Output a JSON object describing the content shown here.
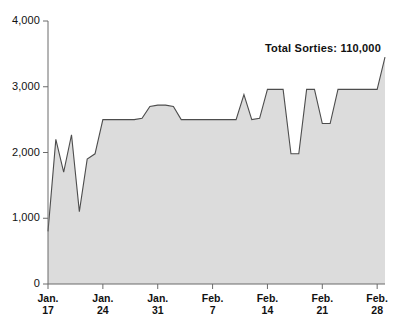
{
  "chart_data": {
    "type": "area",
    "title": "",
    "subtitle": "",
    "xlabel": "",
    "ylabel": "",
    "ylim": [
      0,
      4000
    ],
    "grid": false,
    "legend": null,
    "annotation": "Total  Sorties:  110,000",
    "annotation_label": "Total  Sorties:",
    "annotation_value": "110,000",
    "y_ticks": [
      "4,000",
      "3,000",
      "2,000",
      "1,000",
      "0"
    ],
    "y_tick_values": [
      4000,
      3000,
      2000,
      1000,
      0
    ],
    "x_ticks": [
      {
        "line1": "Jan.",
        "line2": "17"
      },
      {
        "line1": "Jan.",
        "line2": "24"
      },
      {
        "line1": "Jan.",
        "line2": "31"
      },
      {
        "line1": "Feb.",
        "line2": "7"
      },
      {
        "line1": "Feb.",
        "line2": "14"
      },
      {
        "line1": "Feb.",
        "line2": "21"
      },
      {
        "line1": "Feb.",
        "line2": "28"
      }
    ],
    "x_tick_positions": [
      0,
      7,
      14,
      21,
      28,
      35,
      42
    ],
    "x": [
      0,
      1,
      2,
      3,
      4,
      5,
      6,
      7,
      8,
      9,
      10,
      11,
      12,
      13,
      14,
      15,
      16,
      17,
      18,
      19,
      20,
      21,
      22,
      23,
      24,
      25,
      26,
      27,
      28,
      29,
      30,
      31,
      32,
      33,
      34,
      35,
      36,
      37,
      38,
      39,
      40,
      41,
      42,
      43
    ],
    "values": [
      800,
      2200,
      1700,
      2270,
      1100,
      1900,
      1980,
      2500,
      2500,
      2500,
      2500,
      2500,
      2520,
      2700,
      2720,
      2720,
      2700,
      2500,
      2500,
      2500,
      2500,
      2500,
      2500,
      2500,
      2500,
      2880,
      2500,
      2520,
      2960,
      2960,
      2960,
      1980,
      1980,
      2960,
      2960,
      2440,
      2440,
      2960,
      2960,
      2960,
      2960,
      2960,
      2960,
      3450
    ],
    "series": [
      {
        "name": "Daily Sorties",
        "values": [
          800,
          2200,
          1700,
          2270,
          1100,
          1900,
          1980,
          2500,
          2500,
          2500,
          2500,
          2500,
          2520,
          2700,
          2720,
          2720,
          2700,
          2500,
          2500,
          2500,
          2500,
          2500,
          2500,
          2500,
          2500,
          2880,
          2500,
          2520,
          2960,
          2960,
          2960,
          1980,
          1980,
          2960,
          2960,
          2440,
          2440,
          2960,
          2960,
          2960,
          2960,
          2960,
          2960,
          3450
        ]
      }
    ],
    "colors": {
      "area_fill": "#dcdcdc",
      "line": "#4d4d4d",
      "axis": "#6b6b6b",
      "text": "#111111"
    }
  }
}
